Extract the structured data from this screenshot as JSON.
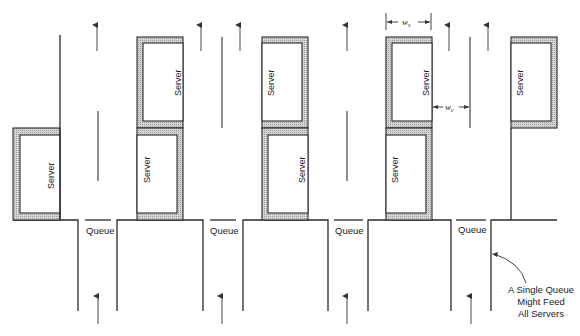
{
  "diagram": {
    "server_label": "Server",
    "queue_label": "Queue",
    "dimensions": {
      "ws": "w",
      "ws_sub": "s",
      "wc": "w",
      "wc_sub": "c"
    },
    "annotation": {
      "line1": "A Single Queue",
      "line2": "Might Feed",
      "line3": "All Servers"
    },
    "colors": {
      "line": "#2a2a2a",
      "shading": "#bdbdbd",
      "background": "#ffffff"
    },
    "columns": [
      {
        "id": 1,
        "servers": 1,
        "queue": "Queue"
      },
      {
        "id": 2,
        "servers": 2,
        "queue": "Queue"
      },
      {
        "id": 3,
        "servers": 2,
        "queue": "Queue"
      },
      {
        "id": 4,
        "servers": 2,
        "queue": "Queue"
      },
      {
        "id": 5,
        "servers": 1
      }
    ]
  }
}
